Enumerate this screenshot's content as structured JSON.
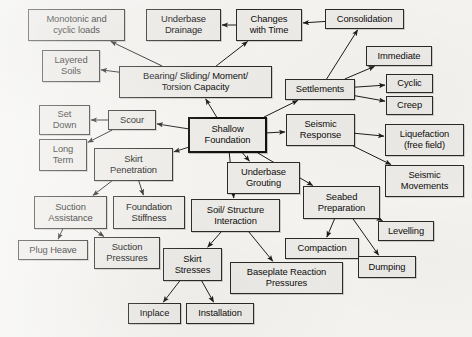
{
  "diagram": {
    "type": "concept-map",
    "canvas": {
      "width": 472,
      "height": 337
    },
    "style": {
      "background_color": "#f3f2ef",
      "node_fill": "#eceae6",
      "node_border": "#2a2a2a",
      "text_color": "#0d0d0d",
      "emphasis_border": "#111111"
    },
    "nodes": [
      {
        "id": "monotonic_cyclic_loads",
        "label": "Monotonic and\ncyclic loads",
        "lines": [
          "Monotonic and",
          "cyclic loads"
        ],
        "x": 28,
        "y": 9,
        "w": 97,
        "h": 32,
        "emphasis": false
      },
      {
        "id": "underbase_drainage",
        "label": "Underbase\nDrainage",
        "lines": [
          "Underbase",
          "Drainage"
        ],
        "x": 146,
        "y": 9,
        "w": 75,
        "h": 32,
        "emphasis": false
      },
      {
        "id": "changes_with_time",
        "label": "Changes\nwith Time",
        "lines": [
          "Changes",
          "with Time"
        ],
        "x": 236,
        "y": 9,
        "w": 66,
        "h": 32,
        "emphasis": false
      },
      {
        "id": "consolidation",
        "label": "Consolidation",
        "lines": [
          "Consolidation"
        ],
        "x": 325,
        "y": 9,
        "w": 79,
        "h": 20,
        "emphasis": false
      },
      {
        "id": "layered_soils",
        "label": "Layered\nSoils",
        "lines": [
          "Layered",
          "Soils"
        ],
        "x": 42,
        "y": 50,
        "w": 58,
        "h": 32,
        "emphasis": false
      },
      {
        "id": "immediate",
        "label": "Immediate",
        "lines": [
          "Immediate"
        ],
        "x": 366,
        "y": 46,
        "w": 66,
        "h": 20,
        "emphasis": false
      },
      {
        "id": "bearing_sliding_moment_torsion",
        "label": "Bearing/ Sliding/ Moment/\nTorsion Capacity",
        "lines": [
          "Bearing/ Sliding/ Moment/",
          "Torsion Capacity"
        ],
        "x": 119,
        "y": 66,
        "w": 153,
        "h": 32,
        "emphasis": false
      },
      {
        "id": "settlements",
        "label": "Settlements",
        "lines": [
          "Settlements"
        ],
        "x": 285,
        "y": 79,
        "w": 70,
        "h": 21,
        "emphasis": false
      },
      {
        "id": "cyclic",
        "label": "Cyclic",
        "lines": [
          "Cyclic"
        ],
        "x": 386,
        "y": 74,
        "w": 47,
        "h": 19,
        "emphasis": false
      },
      {
        "id": "creep",
        "label": "Creep",
        "lines": [
          "Creep"
        ],
        "x": 386,
        "y": 96,
        "w": 47,
        "h": 19,
        "emphasis": false
      },
      {
        "id": "set_down",
        "label": "Set\nDown",
        "lines": [
          "Set",
          "Down"
        ],
        "x": 39,
        "y": 105,
        "w": 51,
        "h": 30,
        "emphasis": false
      },
      {
        "id": "scour",
        "label": "Scour",
        "lines": [
          "Scour"
        ],
        "x": 108,
        "y": 110,
        "w": 48,
        "h": 20,
        "emphasis": false
      },
      {
        "id": "shallow_foundation",
        "label": "Shallow\nFoundation",
        "lines": [
          "Shallow",
          "Foundation"
        ],
        "x": 188,
        "y": 117,
        "w": 79,
        "h": 36,
        "emphasis": true
      },
      {
        "id": "seismic_response",
        "label": "Seismic\nResponse",
        "lines": [
          "Seismic",
          "Response"
        ],
        "x": 286,
        "y": 114,
        "w": 69,
        "h": 32,
        "emphasis": false
      },
      {
        "id": "liquefaction_free_field",
        "label": "Liquefaction\n(free field)",
        "lines": [
          "Liquefaction",
          "(free field)"
        ],
        "x": 385,
        "y": 124,
        "w": 79,
        "h": 32,
        "emphasis": false
      },
      {
        "id": "long_term",
        "label": "Long\nTerm",
        "lines": [
          "Long",
          "Term"
        ],
        "x": 39,
        "y": 139,
        "w": 48,
        "h": 32,
        "emphasis": false
      },
      {
        "id": "skirt_penetration",
        "label": "Skirt\nPenetration",
        "lines": [
          "Skirt",
          "Penetration"
        ],
        "x": 94,
        "y": 148,
        "w": 79,
        "h": 33,
        "emphasis": false
      },
      {
        "id": "underbase_grouting",
        "label": "Underbase\nGrouting",
        "lines": [
          "Underbase",
          "Grouting"
        ],
        "x": 227,
        "y": 162,
        "w": 73,
        "h": 32,
        "emphasis": false
      },
      {
        "id": "seismic_movements",
        "label": "Seismic\nMovements",
        "lines": [
          "Seismic",
          "Movements"
        ],
        "x": 385,
        "y": 165,
        "w": 79,
        "h": 32,
        "emphasis": false
      },
      {
        "id": "seabed_preparation",
        "label": "Seabed\nPreparation",
        "lines": [
          "Seabed",
          "Preparation"
        ],
        "x": 303,
        "y": 186,
        "w": 77,
        "h": 33,
        "emphasis": false
      },
      {
        "id": "suction_assistance",
        "label": "Suction\nAssistance",
        "lines": [
          "Suction",
          "Assistance"
        ],
        "x": 34,
        "y": 196,
        "w": 73,
        "h": 33,
        "emphasis": false
      },
      {
        "id": "foundation_stiffness",
        "label": "Foundation\nStiffness",
        "lines": [
          "Foundation",
          "Stiffness"
        ],
        "x": 113,
        "y": 196,
        "w": 72,
        "h": 33,
        "emphasis": false
      },
      {
        "id": "soil_structure_interaction",
        "label": "Soil/ Structure\nInteraction",
        "lines": [
          "Soil/ Structure",
          "Interaction"
        ],
        "x": 191,
        "y": 199,
        "w": 89,
        "h": 33,
        "emphasis": false
      },
      {
        "id": "levelling",
        "label": "Levelling",
        "lines": [
          "Levelling"
        ],
        "x": 378,
        "y": 221,
        "w": 56,
        "h": 20,
        "emphasis": false
      },
      {
        "id": "plug_heave",
        "label": "Plug Heave",
        "lines": [
          "Plug Heave"
        ],
        "x": 18,
        "y": 240,
        "w": 70,
        "h": 20,
        "emphasis": false
      },
      {
        "id": "suction_pressures",
        "label": "Suction\nPressures",
        "lines": [
          "Suction",
          "Pressures"
        ],
        "x": 94,
        "y": 237,
        "w": 66,
        "h": 32,
        "emphasis": false
      },
      {
        "id": "compaction",
        "label": "Compaction",
        "lines": [
          "Compaction"
        ],
        "x": 285,
        "y": 238,
        "w": 74,
        "h": 21,
        "emphasis": false
      },
      {
        "id": "skirt_stresses",
        "label": "Skirt\nStresses",
        "lines": [
          "Skirt",
          "Stresses"
        ],
        "x": 163,
        "y": 248,
        "w": 59,
        "h": 33,
        "emphasis": false
      },
      {
        "id": "dumping",
        "label": "Dumping",
        "lines": [
          "Dumping"
        ],
        "x": 358,
        "y": 256,
        "w": 58,
        "h": 22,
        "emphasis": false
      },
      {
        "id": "baseplate_reaction_pressures",
        "label": "Baseplate Reaction\nPressures",
        "lines": [
          "Baseplate Reaction",
          "Pressures"
        ],
        "x": 230,
        "y": 262,
        "w": 113,
        "h": 32,
        "emphasis": false
      },
      {
        "id": "inplace",
        "label": "Inplace",
        "lines": [
          "Inplace"
        ],
        "x": 128,
        "y": 303,
        "w": 53,
        "h": 21,
        "emphasis": false
      },
      {
        "id": "installation",
        "label": "Installation",
        "lines": [
          "Installation"
        ],
        "x": 186,
        "y": 303,
        "w": 68,
        "h": 21,
        "emphasis": false
      }
    ],
    "edges": [
      {
        "from": "consolidation",
        "to": "changes_with_time"
      },
      {
        "from": "changes_with_time",
        "to": "underbase_drainage"
      },
      {
        "from": "bearing_sliding_moment_torsion",
        "to": "monotonic_cyclic_loads"
      },
      {
        "from": "bearing_sliding_moment_torsion",
        "to": "layered_soils"
      },
      {
        "from": "bearing_sliding_moment_torsion",
        "to": "changes_with_time"
      },
      {
        "from": "settlements",
        "to": "consolidation"
      },
      {
        "from": "settlements",
        "to": "immediate"
      },
      {
        "from": "settlements",
        "to": "cyclic"
      },
      {
        "from": "settlements",
        "to": "creep"
      },
      {
        "from": "shallow_foundation",
        "to": "bearing_sliding_moment_torsion"
      },
      {
        "from": "shallow_foundation",
        "to": "settlements"
      },
      {
        "from": "shallow_foundation",
        "to": "scour"
      },
      {
        "from": "shallow_foundation",
        "to": "skirt_penetration"
      },
      {
        "from": "shallow_foundation",
        "to": "seismic_response"
      },
      {
        "from": "shallow_foundation",
        "to": "underbase_grouting"
      },
      {
        "from": "shallow_foundation",
        "to": "soil_structure_interaction"
      },
      {
        "from": "shallow_foundation",
        "to": "seabed_preparation"
      },
      {
        "from": "scour",
        "to": "set_down"
      },
      {
        "from": "scour",
        "to": "long_term"
      },
      {
        "from": "skirt_penetration",
        "to": "suction_assistance"
      },
      {
        "from": "skirt_penetration",
        "to": "foundation_stiffness"
      },
      {
        "from": "seismic_response",
        "to": "liquefaction_free_field"
      },
      {
        "from": "seismic_response",
        "to": "seismic_movements"
      },
      {
        "from": "suction_assistance",
        "to": "plug_heave"
      },
      {
        "from": "suction_assistance",
        "to": "suction_pressures"
      },
      {
        "from": "soil_structure_interaction",
        "to": "skirt_stresses"
      },
      {
        "from": "soil_structure_interaction",
        "to": "baseplate_reaction_pressures"
      },
      {
        "from": "seabed_preparation",
        "to": "levelling"
      },
      {
        "from": "seabed_preparation",
        "to": "compaction"
      },
      {
        "from": "seabed_preparation",
        "to": "dumping"
      },
      {
        "from": "skirt_stresses",
        "to": "inplace"
      },
      {
        "from": "skirt_stresses",
        "to": "installation"
      }
    ]
  }
}
